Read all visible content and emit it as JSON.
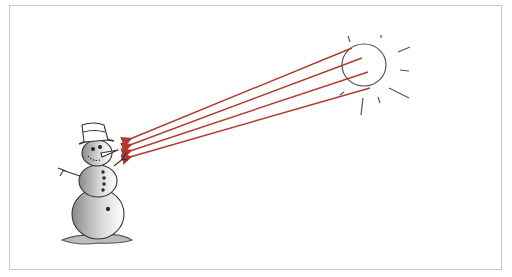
{
  "illustration": {
    "description": "Hand-drawn illustration of a snowman being hit by rays of light from the sun",
    "elements": {
      "snowman": {
        "label": "snowman",
        "accessories": [
          "top-hat",
          "carrot-nose",
          "stick-arms",
          "buttons"
        ]
      },
      "sun": {
        "label": "sun"
      },
      "rays": {
        "count": 4,
        "color": "#b03a2e"
      }
    },
    "colors": {
      "ray": "#b03a2e",
      "outline": "#444444",
      "shadow": "#9a9a9a",
      "frame": "#c8c8c8"
    }
  }
}
